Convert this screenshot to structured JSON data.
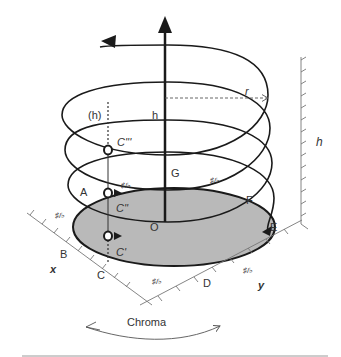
{
  "diagram": {
    "labels": {
      "h_paren": "(h)",
      "h_axis": "h",
      "r": "r",
      "h_scale": "h",
      "C3": "C'''",
      "C2": "C''",
      "C1": "C'",
      "A": "A",
      "B": "B",
      "C": "C",
      "D": "D",
      "E": "E",
      "F": "F",
      "G": "G",
      "O": "O",
      "x": "x",
      "y": "y",
      "chroma": "Chroma",
      "sharp_flat": "♯/♭"
    },
    "colors": {
      "line": "#1a1a1a",
      "disk_fill": "#b9b9b9",
      "axis_gray": "#777777",
      "bottom_rule": "#9a9a9a"
    }
  }
}
